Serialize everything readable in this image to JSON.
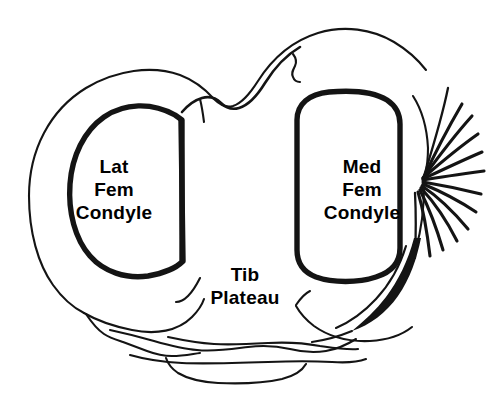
{
  "figure": {
    "kind": "anatomical-line-drawing",
    "background_color": "#ffffff",
    "ink_color": "#141414"
  },
  "labels": {
    "lateral_condyle": {
      "name": "Lat Fem Condyle",
      "line1": "Lat",
      "line2": "Fem",
      "line3": "Condyle"
    },
    "medial_condyle": {
      "name": "Med Fem Condyle",
      "line1": "Med",
      "line2": "Fem",
      "line3": "Condyle"
    },
    "tibial_plateau": {
      "name": "Tib Plateau",
      "line1": "Tib",
      "line2": "Plateau"
    }
  }
}
